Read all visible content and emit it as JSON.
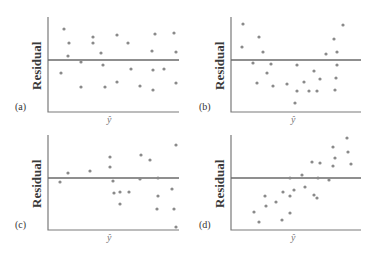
{
  "chart_data": [
    {
      "type": "scatter",
      "panel": "(a)",
      "title": "",
      "xlabel": "ŷ",
      "ylabel": "Residual",
      "zero_line": true,
      "grid": false,
      "axis_box": {
        "x0": 48,
        "x1": 179,
        "y_top": 17,
        "y_bottom": 112,
        "y_zero": 60
      },
      "points": [
        [
          64,
          29
        ],
        [
          69,
          43
        ],
        [
          68,
          56
        ],
        [
          61,
          73
        ],
        [
          81,
          62
        ],
        [
          81,
          87
        ],
        [
          93,
          37
        ],
        [
          93,
          43
        ],
        [
          101,
          53
        ],
        [
          103,
          65
        ],
        [
          105,
          87
        ],
        [
          117,
          35
        ],
        [
          117,
          82
        ],
        [
          128,
          43
        ],
        [
          131,
          69
        ],
        [
          140,
          86
        ],
        [
          152,
          51
        ],
        [
          153,
          70
        ],
        [
          155,
          34
        ],
        [
          153,
          90
        ],
        [
          164,
          69
        ],
        [
          174,
          33
        ],
        [
          176,
          52
        ],
        [
          176,
          83
        ]
      ],
      "pattern": "random scatter (no pattern)"
    },
    {
      "type": "scatter",
      "panel": "(b)",
      "title": "",
      "xlabel": "ŷ",
      "ylabel": "Residual",
      "zero_line": true,
      "grid": false,
      "axis_box": {
        "x0": 231,
        "x1": 361,
        "y_top": 17,
        "y_bottom": 112,
        "y_zero": 60
      },
      "points": [
        [
          243,
          24
        ],
        [
          242,
          47
        ],
        [
          259,
          37
        ],
        [
          263,
          52
        ],
        [
          253,
          63
        ],
        [
          271,
          64
        ],
        [
          267,
          73
        ],
        [
          257,
          83
        ],
        [
          273,
          86
        ],
        [
          287,
          84
        ],
        [
          297,
          91
        ],
        [
          297,
          65
        ],
        [
          295,
          103
        ],
        [
          309,
          91
        ],
        [
          304,
          82
        ],
        [
          314,
          71
        ],
        [
          320,
          79
        ],
        [
          317,
          91
        ],
        [
          326,
          54
        ],
        [
          334,
          39
        ],
        [
          337,
          52
        ],
        [
          337,
          65
        ],
        [
          336,
          78
        ],
        [
          335,
          90
        ],
        [
          343,
          25
        ]
      ],
      "pattern": "curved (U-shape)"
    },
    {
      "type": "scatter",
      "panel": "(c)",
      "title": "",
      "xlabel": "ŷ",
      "ylabel": "Residual",
      "zero_line": true,
      "grid": false,
      "axis_box": {
        "x0": 48,
        "x1": 179,
        "y_top": 135,
        "y_bottom": 230,
        "y_zero": 178
      },
      "points": [
        [
          60,
          182
        ],
        [
          68,
          173
        ],
        [
          90,
          171
        ],
        [
          110,
          157
        ],
        [
          110,
          167
        ],
        [
          113,
          181
        ],
        [
          114,
          193
        ],
        [
          120,
          192
        ],
        [
          120,
          204
        ],
        [
          129,
          192
        ],
        [
          141,
          155
        ],
        [
          140,
          179
        ],
        [
          150,
          160
        ],
        [
          158,
          178
        ],
        [
          157,
          209
        ],
        [
          158,
          196
        ],
        [
          174,
          209
        ],
        [
          172,
          189
        ],
        [
          176,
          145
        ],
        [
          176,
          227
        ]
      ],
      "pattern": "fan-shaped (increasing spread)"
    },
    {
      "type": "scatter",
      "panel": "(d)",
      "title": "",
      "xlabel": "ŷ",
      "ylabel": "Residual",
      "zero_line": true,
      "grid": false,
      "axis_box": {
        "x0": 231,
        "x1": 361,
        "y_top": 135,
        "y_bottom": 230,
        "y_zero": 178
      },
      "points": [
        [
          254,
          212
        ],
        [
          259,
          222
        ],
        [
          265,
          196
        ],
        [
          266,
          206
        ],
        [
          276,
          202
        ],
        [
          282,
          220
        ],
        [
          283,
          192
        ],
        [
          290,
          178
        ],
        [
          290,
          196
        ],
        [
          290,
          213
        ],
        [
          294,
          190
        ],
        [
          302,
          175
        ],
        [
          305,
          187
        ],
        [
          312,
          162
        ],
        [
          314,
          195
        ],
        [
          317,
          198
        ],
        [
          320,
          163
        ],
        [
          318,
          178
        ],
        [
          329,
          180
        ],
        [
          333,
          166
        ],
        [
          333,
          147
        ],
        [
          335,
          158
        ],
        [
          347,
          138
        ],
        [
          348,
          152
        ],
        [
          351,
          164
        ]
      ],
      "pattern": "linear increasing trend"
    }
  ],
  "panels": [
    {
      "label": "(a)",
      "ylabel": "Residual",
      "xlabel": "ŷ"
    },
    {
      "label": "(b)",
      "ylabel": "Residual",
      "xlabel": "ŷ"
    },
    {
      "label": "(c)",
      "ylabel": "Residual",
      "xlabel": "ŷ"
    },
    {
      "label": "(d)",
      "ylabel": "Residual",
      "xlabel": "ŷ"
    }
  ],
  "colors": {
    "axis": "#7a7a7a",
    "zero_line": "#6a6a6a",
    "points": "#8a8a8a",
    "text": "#3a3a3a"
  }
}
